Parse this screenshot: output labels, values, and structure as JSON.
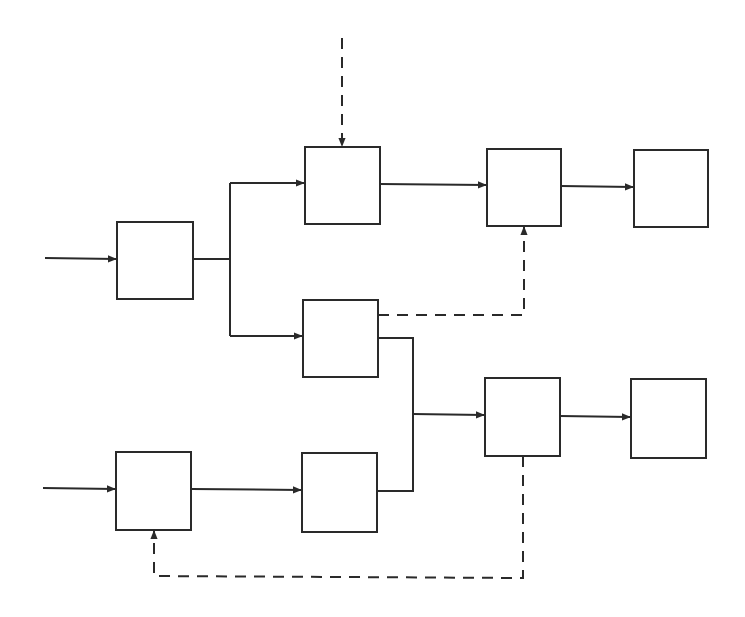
{
  "diagram": {
    "type": "block-diagram",
    "background": "#ffffff",
    "stroke_color": "#2a2a2a",
    "blocks": [
      {
        "id": "A",
        "x": 117,
        "y": 222,
        "w": 76,
        "h": 77,
        "label": ""
      },
      {
        "id": "B",
        "x": 305,
        "y": 147,
        "w": 75,
        "h": 77,
        "label": ""
      },
      {
        "id": "C",
        "x": 487,
        "y": 149,
        "w": 74,
        "h": 77,
        "label": ""
      },
      {
        "id": "D",
        "x": 634,
        "y": 150,
        "w": 74,
        "h": 77,
        "label": ""
      },
      {
        "id": "E",
        "x": 303,
        "y": 300,
        "w": 75,
        "h": 77,
        "label": ""
      },
      {
        "id": "F",
        "x": 116,
        "y": 452,
        "w": 75,
        "h": 78,
        "label": ""
      },
      {
        "id": "G",
        "x": 302,
        "y": 453,
        "w": 75,
        "h": 79,
        "label": ""
      },
      {
        "id": "H",
        "x": 485,
        "y": 378,
        "w": 75,
        "h": 78,
        "label": ""
      },
      {
        "id": "I",
        "x": 631,
        "y": 379,
        "w": 75,
        "h": 79,
        "label": ""
      }
    ],
    "connections": [
      {
        "from": "input-1",
        "to": "A",
        "style": "solid"
      },
      {
        "from": "A",
        "to": "B",
        "style": "solid"
      },
      {
        "from": "A",
        "to": "E",
        "style": "solid"
      },
      {
        "from": "external-top",
        "to": "B",
        "style": "dashed"
      },
      {
        "from": "B",
        "to": "C",
        "style": "solid"
      },
      {
        "from": "E",
        "to": "C",
        "style": "dashed"
      },
      {
        "from": "C",
        "to": "D",
        "style": "solid"
      },
      {
        "from": "input-2",
        "to": "F",
        "style": "solid"
      },
      {
        "from": "F",
        "to": "G",
        "style": "solid"
      },
      {
        "from": "E",
        "to": "H",
        "style": "solid"
      },
      {
        "from": "G",
        "to": "H",
        "style": "solid"
      },
      {
        "from": "H",
        "to": "I",
        "style": "solid"
      },
      {
        "from": "H",
        "to": "F",
        "style": "dashed"
      }
    ]
  }
}
